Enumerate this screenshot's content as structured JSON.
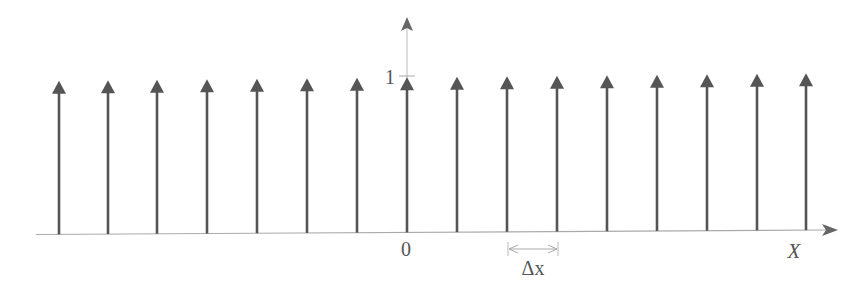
{
  "diagram": {
    "type": "impulse_train",
    "impulse_count": 16,
    "impulse_height": 1,
    "impulse_positions_px": [
      59,
      108,
      157,
      207,
      257,
      307,
      357,
      407,
      457,
      507,
      557,
      607,
      657,
      707,
      757,
      806
    ],
    "colors": {
      "impulse": "#555555",
      "axis": "#aaaaaa",
      "text": "#555555"
    }
  },
  "labels": {
    "origin": "0",
    "unit": "1",
    "x_axis": "X",
    "spacing": "Δx"
  }
}
